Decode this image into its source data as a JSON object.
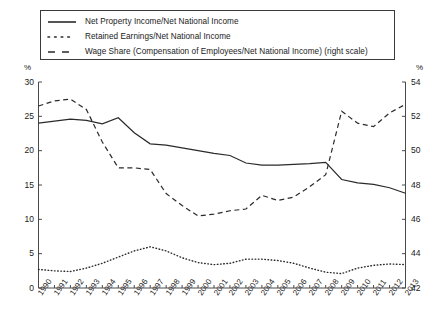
{
  "chart_data": {
    "type": "line",
    "title": "",
    "xlabel": "",
    "ylabel": "%",
    "y2label": "%",
    "grid": false,
    "legend_position": "top",
    "ylim": [
      0,
      30
    ],
    "y2lim": [
      42,
      54
    ],
    "yticks": [
      "0",
      "5",
      "10",
      "15",
      "20",
      "25",
      "30"
    ],
    "y2ticks": [
      "42",
      "44",
      "46",
      "48",
      "50",
      "52",
      "54"
    ],
    "categories": [
      "1990",
      "1991",
      "1992",
      "1993",
      "1994",
      "1995",
      "1996",
      "1997",
      "1998",
      "1999",
      "2000",
      "2001",
      "2002",
      "2003",
      "2004",
      "2005",
      "2006",
      "2007",
      "2008",
      "2009",
      "2010",
      "2011",
      "2012",
      "2013"
    ],
    "series": [
      {
        "name": "Net Property Income/Net National Income",
        "style": "solid",
        "axis": "left",
        "values": [
          24.0,
          24.3,
          24.6,
          24.4,
          23.9,
          24.8,
          22.6,
          21.0,
          20.8,
          20.4,
          20.0,
          19.6,
          19.3,
          18.2,
          17.9,
          17.9,
          18.0,
          18.1,
          18.3,
          15.8,
          15.3,
          15.1,
          14.6,
          13.8
        ]
      },
      {
        "name": "Retained Earnings/Net National Income",
        "style": "dotted",
        "axis": "left",
        "values": [
          2.7,
          2.5,
          2.4,
          2.9,
          3.6,
          4.5,
          5.4,
          6.0,
          5.4,
          4.4,
          3.7,
          3.4,
          3.6,
          4.2,
          4.2,
          4.0,
          3.6,
          2.9,
          2.3,
          2.1,
          2.9,
          3.3,
          3.5,
          3.4
        ]
      },
      {
        "name": "Wage Share (Compensation of Employees/Net National Income) (right scale)",
        "style": "dashed",
        "axis": "right",
        "values": [
          52.6,
          52.9,
          53.0,
          52.4,
          50.5,
          49.0,
          49.0,
          48.9,
          47.5,
          46.8,
          46.2,
          46.3,
          46.5,
          46.6,
          47.4,
          47.1,
          47.3,
          47.9,
          48.6,
          52.3,
          51.6,
          51.4,
          52.2,
          52.7
        ]
      }
    ]
  },
  "legend": {
    "items": [
      {
        "label": "Net Property Income/Net National Income",
        "marker": "solid-line-marker"
      },
      {
        "label": "Retained Earnings/Net National Income",
        "marker": "dotted-line-marker"
      },
      {
        "label": "Wage Share (Compensation of Employees/Net National Income) (right scale)",
        "marker": "dashed-line-marker"
      }
    ]
  },
  "axes": {
    "left_unit": "%",
    "right_unit": "%"
  }
}
